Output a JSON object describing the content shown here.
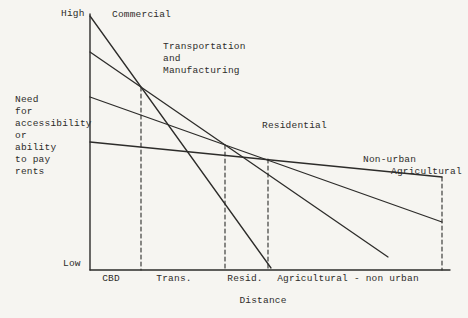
{
  "figure": {
    "background": "#f6f5f1",
    "ink": "#2d2c2a"
  },
  "labels": {
    "y_high": "High",
    "y_low": "Low",
    "y_axis_caption": "Need\nfor\naccessibility\nor\nability\nto pay\nrents",
    "x_axis_caption": "Distance",
    "curve_commercial": "Commercial",
    "curve_transport": "Transportation\nand\nManufacturing",
    "curve_residential": "Residential",
    "curve_agricultural_line1": "Non-urban",
    "curve_agricultural_line2": "Agricultural",
    "zone_cbd": "CBD",
    "zone_trans": "Trans.",
    "zone_resid": "Resid.",
    "zone_agri": "Agricultural - non urban"
  },
  "chart_data": {
    "type": "line",
    "title": "",
    "xlabel": "Distance",
    "ylabel": "Need for accessibility or ability to pay rents",
    "y_axis_ticks": [
      "Low",
      "High"
    ],
    "y_scale": "qualitative 0-100 (Low to High)",
    "grid": false,
    "legend_position": "labels placed beside each curve",
    "series": [
      {
        "name": "Commercial",
        "x": [
          0.0,
          0.5
        ],
        "y": [
          99,
          1
        ]
      },
      {
        "name": "Transportation and Manufacturing",
        "x": [
          0.0,
          0.83
        ],
        "y": [
          85,
          5
        ]
      },
      {
        "name": "Residential",
        "x": [
          0.0,
          0.98
        ],
        "y": [
          68,
          19
        ]
      },
      {
        "name": "Non-urban Agricultural",
        "x": [
          0.0,
          0.98
        ],
        "y": [
          50,
          36
        ]
      }
    ],
    "x_zones": [
      {
        "label": "CBD",
        "from": 0.0,
        "to": 0.14
      },
      {
        "label": "Trans.",
        "from": 0.14,
        "to": 0.375
      },
      {
        "label": "Resid.",
        "from": 0.375,
        "to": 0.49
      },
      {
        "label": "Agricultural - non urban",
        "from": 0.49,
        "to": 0.98
      }
    ],
    "boundary_lines": {
      "style": "dashed vertical",
      "x": [
        0.14,
        0.375,
        0.49,
        0.98
      ]
    }
  },
  "geometry": {
    "axis": {
      "y": {
        "x1": 90,
        "y1": 14,
        "x2": 90,
        "y2": 270
      },
      "x": {
        "x1": 90,
        "y1": 270,
        "x2": 450,
        "y2": 270
      }
    },
    "lines": [
      {
        "name": "commercial-line",
        "x1": 90,
        "y1": 16,
        "x2": 271,
        "y2": 268
      },
      {
        "name": "transport-line",
        "x1": 90,
        "y1": 52,
        "x2": 388,
        "y2": 257
      },
      {
        "name": "residential-line",
        "x1": 90,
        "y1": 97,
        "x2": 442,
        "y2": 222
      },
      {
        "name": "agricultural-line",
        "x1": 90,
        "y1": 142,
        "x2": 442,
        "y2": 177
      }
    ],
    "dashed": [
      {
        "name": "boundary-dash-cbd-trans",
        "x": 141,
        "y1": 87,
        "y2": 270
      },
      {
        "name": "boundary-dash-trans-resid",
        "x": 225,
        "y1": 145,
        "y2": 270
      },
      {
        "name": "boundary-dash-resid-agri",
        "x": 268,
        "y1": 159,
        "y2": 270
      },
      {
        "name": "boundary-dash-right-edge",
        "x": 442,
        "y1": 177,
        "y2": 270
      }
    ],
    "stroke_width_line": 1.3,
    "stroke_width_axis": 1.4,
    "stroke_width_dash": 1.1,
    "dash_pattern": "4 3"
  }
}
